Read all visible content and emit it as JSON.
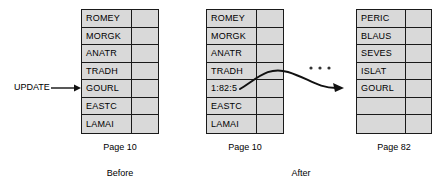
{
  "diagram": {
    "title_before": "Before",
    "title_after": "After",
    "update_label": "UPDATE",
    "ellipsis": "• • •",
    "colors": {
      "cell_fill": "#d9d9d9",
      "border": "#1a1a1a",
      "shadow": "#1a1a1a",
      "text": "#000000",
      "arrow": "#111111"
    }
  },
  "tables": {
    "before": {
      "caption": "Page 10",
      "rows": [
        {
          "value": "ROMEY"
        },
        {
          "value": "MORGK"
        },
        {
          "value": "ANATR"
        },
        {
          "value": "TRADH"
        },
        {
          "value": "GOURL"
        },
        {
          "value": "EASTC"
        },
        {
          "value": "LAMAI"
        }
      ]
    },
    "after_source": {
      "caption": "Page 10",
      "rows": [
        {
          "value": "ROMEY"
        },
        {
          "value": "MORGK"
        },
        {
          "value": "ANATR"
        },
        {
          "value": "TRADH"
        },
        {
          "value": "1:82:5"
        },
        {
          "value": "EASTC"
        },
        {
          "value": "LAMAI"
        }
      ]
    },
    "after_destination": {
      "caption": "Page 82",
      "rows": [
        {
          "value": "PERIC"
        },
        {
          "value": "BLAUS"
        },
        {
          "value": "SEVES"
        },
        {
          "value": "ISLAT"
        },
        {
          "value": "GOURL"
        },
        {
          "value": ""
        },
        {
          "value": ""
        }
      ]
    }
  }
}
